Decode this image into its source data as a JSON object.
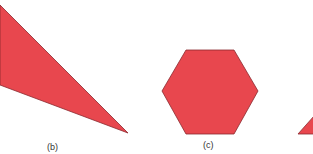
{
  "figure": {
    "fill_color": "#e8474e",
    "stroke_color": "#8a2a2e",
    "shapes": [
      {
        "id": "b",
        "type": "triangle",
        "label": "(b)"
      },
      {
        "id": "c",
        "type": "hexagon",
        "label": "(c)"
      },
      {
        "id": "d",
        "type": "triangle-partial",
        "label": ""
      }
    ]
  }
}
